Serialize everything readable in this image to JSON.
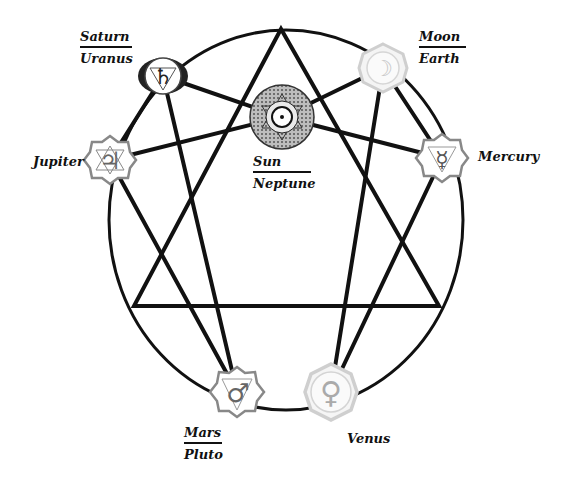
{
  "diagram": {
    "type": "enneagram-planetary-chakras",
    "colors": {
      "line": "#111111",
      "light_symbol": "#c8c8c8",
      "mid_symbol": "#777777",
      "dark_symbol": "#222222"
    },
    "nodes": [
      {
        "id": "saturn",
        "glyph": "♄",
        "top": "Saturn",
        "bottom": "Uranus",
        "cx": 163,
        "cy": 76
      },
      {
        "id": "moon",
        "glyph": "☽",
        "top": "Moon",
        "bottom": "Earth",
        "cx": 383,
        "cy": 68
      },
      {
        "id": "sun",
        "glyph": "⊙",
        "top": "Sun",
        "bottom": "Neptune",
        "cx": 282,
        "cy": 117
      },
      {
        "id": "jupiter",
        "glyph": "♃",
        "label": "Jupiter",
        "cx": 110,
        "cy": 160
      },
      {
        "id": "mercury",
        "glyph": "☿",
        "label": "Mercury",
        "cx": 442,
        "cy": 158
      },
      {
        "id": "mars",
        "glyph": "♂",
        "top": "Mars",
        "bottom": "Pluto",
        "cx": 237,
        "cy": 392
      },
      {
        "id": "venus",
        "glyph": "♀",
        "label": "Venus",
        "cx": 331,
        "cy": 392
      }
    ],
    "labels": {
      "saturn": {
        "top": "Saturn",
        "bottom": "Uranus"
      },
      "moon": {
        "top": "Moon",
        "bottom": "Earth"
      },
      "sun": {
        "top": "Sun",
        "bottom": "Neptune"
      },
      "jupiter": "Jupiter",
      "mercury": "Mercury",
      "mars": {
        "top": "Mars",
        "bottom": "Pluto"
      },
      "venus": "Venus"
    },
    "glyphs": {
      "saturn": "♄",
      "moon": "☽",
      "sun": "⊙",
      "jupiter": "♃",
      "mercury": "☿",
      "mars": "♂",
      "venus": "♀"
    },
    "connections": [
      [
        "saturn",
        "sun"
      ],
      [
        "saturn",
        "jupiter"
      ],
      [
        "saturn",
        "mars"
      ],
      [
        "moon",
        "sun"
      ],
      [
        "moon",
        "mercury"
      ],
      [
        "moon",
        "venus"
      ],
      [
        "sun",
        "jupiter"
      ],
      [
        "sun",
        "mercury"
      ],
      [
        "jupiter",
        "mars"
      ],
      [
        "mercury",
        "venus"
      ]
    ],
    "triangle": [
      [
        281,
        29
      ],
      [
        134,
        306
      ],
      [
        439,
        306
      ]
    ]
  }
}
